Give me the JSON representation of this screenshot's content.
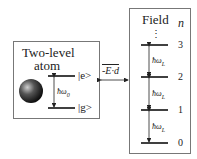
{
  "atom": {
    "title_line1": "Two-level",
    "title_line2": "atom",
    "excited": "|e>",
    "ground": "|g>",
    "energy_gap": "ħω",
    "energy_gap_sub": "0"
  },
  "coupling": {
    "label": "-E·d"
  },
  "field": {
    "title": "Field",
    "index_label": "n",
    "ellipsis": "⋮",
    "levels": [
      "3",
      "2",
      "1",
      "0"
    ],
    "gap": "ħω",
    "gap_sub": "L"
  }
}
